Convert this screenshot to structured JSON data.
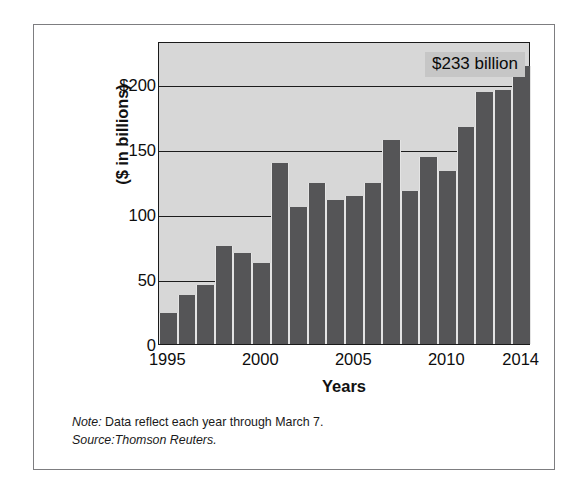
{
  "chart_data": {
    "type": "bar",
    "title": "",
    "subtitle": "",
    "xlabel": "Years",
    "ylabel": "($ in billions)",
    "categories": [
      "1995",
      "1996",
      "1997",
      "1998",
      "1999",
      "2000",
      "2001",
      "2002",
      "2003",
      "2004",
      "2005",
      "2006",
      "2007",
      "2008",
      "2009",
      "2010",
      "2011",
      "2012",
      "2013",
      "2014"
    ],
    "values": [
      24,
      38,
      45,
      75,
      70,
      62,
      139,
      105,
      124,
      111,
      114,
      124,
      157,
      118,
      144,
      133,
      167,
      194,
      195,
      214
    ],
    "ylim": [
      0,
      233
    ],
    "yticks": [
      0,
      50,
      100,
      150,
      200
    ],
    "ytick_labels": [
      "0",
      "50",
      "100",
      "150",
      "$200"
    ],
    "xtick_labels": [
      "1995",
      "2000",
      "2005",
      "2010",
      "2014"
    ],
    "xtick_categories": [
      "1995",
      "2000",
      "2005",
      "2010",
      "2014"
    ],
    "grid": true,
    "grid_axis": "y",
    "legend": false,
    "annotations": [
      {
        "text": "$233 billion",
        "target_category": "2014",
        "position": "top-right"
      }
    ],
    "colors": {
      "bar": "#555557",
      "plot_background": "#d7d7d7",
      "gridline": "#1c1c1c",
      "annotation_background": "#c6c6c6",
      "frame": "#7d7d80",
      "text": "#0d0d0d"
    }
  },
  "axis": {
    "y_title": "($ in billions)",
    "x_title": "Years"
  },
  "annotation": {
    "value_label": "$233 billion"
  },
  "footnotes": {
    "note_lead": "Note:",
    "note_text": " Data reflect each year through March 7.",
    "source_lead": "Source:",
    "source_text": "Thomson Reuters."
  }
}
